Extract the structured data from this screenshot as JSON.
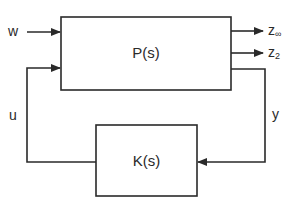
{
  "diagram": {
    "type": "block-diagram",
    "title": "",
    "blocks": [
      {
        "id": "plant",
        "label": "P(s)"
      },
      {
        "id": "controller",
        "label": "K(s)"
      }
    ],
    "signals": {
      "w": {
        "label": "w",
        "from": "external",
        "to": "plant"
      },
      "u": {
        "label": "u",
        "from": "controller",
        "to": "plant"
      },
      "z_inf": {
        "label": "z",
        "subscript": "∞",
        "from": "plant",
        "to": "external"
      },
      "z_2": {
        "label": "z",
        "subscript": "2",
        "from": "plant",
        "to": "external"
      },
      "y": {
        "label": "y",
        "from": "plant",
        "to": "controller"
      }
    },
    "colors": {
      "line": "#2a2a2a",
      "background": "#ffffff"
    }
  }
}
